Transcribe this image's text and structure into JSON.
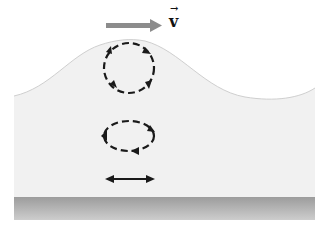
{
  "diagram": {
    "velocity_label": "v",
    "velocity_label_arrow": "→",
    "colors": {
      "water": "#f1f1f1",
      "surface_line": "#cfcfcf",
      "bottom_top": "#9c9c9c",
      "bottom_bottom": "#cdcdcd",
      "velocity_arrow": "#8c8c8c",
      "orbit": "#1a1a1a"
    },
    "elements": [
      {
        "name": "velocity-arrow",
        "description": "Gray arrow pointing right indicating wave velocity"
      },
      {
        "name": "large-circular-orbit",
        "description": "Dashed circular orbit near surface, clockwise arrows"
      },
      {
        "name": "elliptical-orbit",
        "description": "Dashed flattened elliptical orbit at mid-depth, clockwise arrows"
      },
      {
        "name": "horizontal-oscillation",
        "description": "Double-headed horizontal arrow near bottom"
      },
      {
        "name": "sea-floor",
        "description": "Gray gradient band representing the bottom"
      }
    ]
  }
}
